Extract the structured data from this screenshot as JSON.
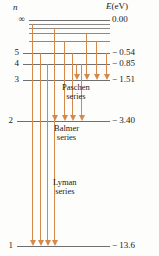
{
  "figure": {
    "axis_left_label": "n",
    "axis_right_label_prefix": "E",
    "axis_right_label_unit": "(eV)",
    "line_color": "#6f6f70",
    "arrow_color": "#d4884a",
    "text_color": "#1a1a1a",
    "background": "#fdfdfc"
  },
  "levels": [
    {
      "n": "∞",
      "energy": "0.00",
      "y": 20,
      "x1": 29,
      "x2": 110,
      "show_n": true,
      "show_e": true
    },
    {
      "n": "",
      "energy": "",
      "y": 24,
      "x1": 29,
      "x2": 110,
      "show_n": false,
      "show_e": false
    },
    {
      "n": "",
      "energy": "",
      "y": 28,
      "x1": 29,
      "x2": 110,
      "show_n": false,
      "show_e": false
    },
    {
      "n": "",
      "energy": "",
      "y": 33,
      "x1": 29,
      "x2": 110,
      "show_n": false,
      "show_e": false
    },
    {
      "n": "",
      "energy": "",
      "y": 41,
      "x1": 29,
      "x2": 110,
      "show_n": false,
      "show_e": false
    },
    {
      "n": "5",
      "energy": "− 0.54",
      "y": 53,
      "x1": 23,
      "x2": 110,
      "show_n": true,
      "show_e": true
    },
    {
      "n": "4",
      "energy": "− 0.85",
      "y": 64,
      "x1": 23,
      "x2": 110,
      "show_n": true,
      "show_e": true
    },
    {
      "n": "3",
      "energy": "− 1.51",
      "y": 80,
      "x1": 23,
      "x2": 110,
      "show_n": true,
      "show_e": true
    },
    {
      "n": "2",
      "energy": "− 3.40",
      "y": 121,
      "x1": 17,
      "x2": 110,
      "show_n": true,
      "show_e": true
    },
    {
      "n": "1",
      "energy": "− 13.6",
      "y": 246,
      "x1": 17,
      "x2": 110,
      "show_n": true,
      "show_e": true
    }
  ],
  "series": [
    {
      "name": "Paschen series",
      "label_lines": [
        "Paschen",
        "series"
      ],
      "label_x": 62,
      "label_y": 83,
      "target_y": 80,
      "transitions": [
        {
          "from_y": 33,
          "x": 86
        },
        {
          "from_y": 41,
          "x": 96
        },
        {
          "from_y": 53,
          "x": 106
        },
        {
          "from_y": 64,
          "x": 76
        }
      ]
    },
    {
      "name": "Balmer series",
      "label_lines": [
        "Balmer",
        "series"
      ],
      "label_x": 54,
      "label_y": 124,
      "target_y": 121,
      "transitions": [
        {
          "from_y": 28,
          "x": 54
        },
        {
          "from_y": 41,
          "x": 64
        },
        {
          "from_y": 53,
          "x": 72
        },
        {
          "from_y": 64,
          "x": 81
        }
      ]
    },
    {
      "name": "Lyman series",
      "label_lines": [
        "Lyman",
        "series"
      ],
      "label_x": 53,
      "label_y": 178,
      "target_y": 246,
      "transitions": [
        {
          "from_y": 24,
          "x": 32
        },
        {
          "from_y": 53,
          "x": 40
        },
        {
          "from_y": 64,
          "x": 47
        },
        {
          "from_y": 80,
          "x": 54
        }
      ]
    }
  ]
}
